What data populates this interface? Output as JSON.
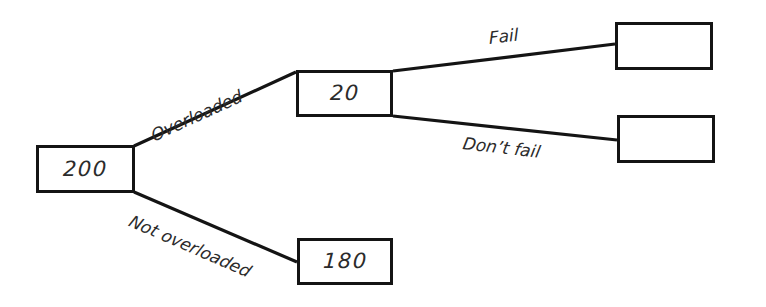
{
  "diagram": {
    "type": "decision-tree",
    "title": "",
    "background_color": "#ffffff",
    "line_color": "#141414",
    "text_color": "#2b2b2b",
    "nodes": [
      {
        "id": "root",
        "label": "200",
        "x": 36,
        "y": 145,
        "width": 99,
        "height": 48
      },
      {
        "id": "overloaded",
        "label": "20",
        "x": 296,
        "y": 70,
        "width": 97,
        "height": 47
      },
      {
        "id": "not-overloaded",
        "label": "180",
        "x": 297,
        "y": 238,
        "width": 96,
        "height": 47
      },
      {
        "id": "fail",
        "label": "",
        "x": 615,
        "y": 22,
        "width": 98,
        "height": 48
      },
      {
        "id": "dont-fail",
        "label": "",
        "x": 617,
        "y": 115,
        "width": 98,
        "height": 48
      }
    ],
    "edges": [
      {
        "id": "edge-overloaded",
        "label": "Overloaded",
        "from": "root",
        "to": "overloaded",
        "x1": 134,
        "y1": 146,
        "x2": 296,
        "y2": 72,
        "label_x": 152,
        "label_y": 128,
        "label_rotation": -24.5
      },
      {
        "id": "edge-not-overloaded",
        "label": "Not overloaded",
        "from": "root",
        "to": "not-overloaded",
        "x1": 134,
        "y1": 192,
        "x2": 297,
        "y2": 262,
        "label_x": 130,
        "label_y": 212,
        "label_rotation": 23.5
      },
      {
        "id": "edge-fail",
        "label": "Fail",
        "from": "overloaded",
        "to": "fail",
        "x1": 393,
        "y1": 71,
        "x2": 615,
        "y2": 44,
        "label_x": 489,
        "label_y": 30,
        "label_rotation": -7
      },
      {
        "id": "edge-dont-fail",
        "label": "Don’t fail",
        "from": "overloaded",
        "to": "dont-fail",
        "x1": 393,
        "y1": 116,
        "x2": 617,
        "y2": 140,
        "label_x": 463,
        "label_y": 135,
        "label_rotation": 6.5
      }
    ]
  }
}
